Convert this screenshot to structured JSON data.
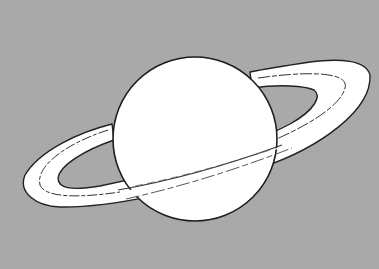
{
  "illustration": {
    "subject": "Saturn",
    "style": "black line drawing on gray background",
    "colors": {
      "background": "#a9a9a9",
      "fill": "#ffffff",
      "outline": "#222222"
    }
  }
}
